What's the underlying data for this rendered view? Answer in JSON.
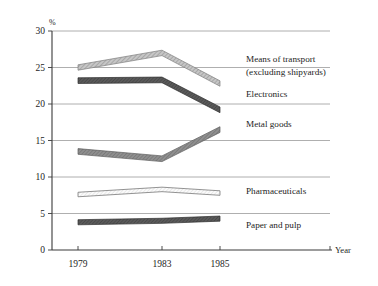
{
  "chart_data": {
    "type": "line",
    "title": "",
    "subtitle": "",
    "xlabel": "Year",
    "ylabel": "%",
    "x": [
      1979,
      1983,
      1985
    ],
    "categories": [
      "1979",
      "1983",
      "1985"
    ],
    "xtick_labels": [
      "1979",
      "1983",
      "1985"
    ],
    "ytick_labels": [
      "0",
      "5",
      "10",
      "15",
      "20",
      "25",
      "30"
    ],
    "yticks": [
      0,
      5,
      10,
      15,
      20,
      25,
      30
    ],
    "ylim": [
      0,
      30
    ],
    "xlim": [
      1978.2,
      1986.4
    ],
    "grid": "horizontal",
    "legend_position": "inline-right",
    "y_unit_label": "%",
    "series": [
      {
        "name": "Means of transport (excluding shipyards)",
        "label_line1": "Means of transport",
        "label_line2": "(excluding shipyards)",
        "values": [
          25.0,
          27.0,
          22.8
        ],
        "fill": "#b9b9b9",
        "style": "hatched-light",
        "band": 0.9
      },
      {
        "name": "Electronics",
        "label_line1": "Electronics",
        "label_line2": "",
        "values": [
          23.2,
          23.3,
          19.2
        ],
        "fill": "#575757",
        "style": "solid-dark",
        "band": 0.95
      },
      {
        "name": "Metal goods",
        "label_line1": "Metal goods",
        "label_line2": "",
        "values": [
          13.5,
          12.5,
          16.5
        ],
        "fill": "#8a8a8a",
        "style": "solid-mid",
        "band": 0.95
      },
      {
        "name": "Pharmaceuticals",
        "label_line1": "Pharmaceuticals",
        "label_line2": "",
        "values": [
          7.6,
          8.3,
          7.8
        ],
        "fill": "#f2f2f2",
        "style": "outlined-white",
        "band": 0.75
      },
      {
        "name": "Paper and pulp",
        "label_line1": "Paper and pulp",
        "label_line2": "",
        "values": [
          3.8,
          4.0,
          4.3
        ],
        "fill": "#4a4a4a",
        "style": "solid-dark",
        "band": 0.85
      }
    ],
    "colors": {
      "axis": "#3a3a3a",
      "grid": "#9a9a9a",
      "text": "#1d1d1d",
      "background": "#ffffff"
    }
  }
}
